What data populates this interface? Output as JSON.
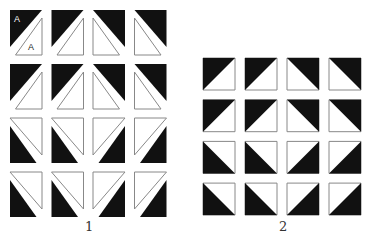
{
  "figure1": {
    "label": "1",
    "tile_letter": "A",
    "origin": {
      "x": 10,
      "y": 10
    },
    "tile_w": 32,
    "tile_h": 45,
    "col_step": 41.5,
    "row_step": 54,
    "rows": [
      [
        "tl",
        "tl",
        "tr",
        "tr"
      ],
      [
        "tl",
        "tl",
        "tr",
        "tr"
      ],
      [
        "bl",
        "bl",
        "br",
        "br"
      ],
      [
        "bl",
        "bl",
        "br",
        "br"
      ]
    ]
  },
  "figure2": {
    "label": "2",
    "origin": {
      "x": 203,
      "y": 58
    },
    "tile_size": 32,
    "col_step": 42,
    "row_step": 41.7,
    "rows": [
      [
        "tl",
        "tl",
        "tr",
        "tr"
      ],
      [
        "tl",
        "tl",
        "tr",
        "tr"
      ],
      [
        "bl",
        "bl",
        "br",
        "br"
      ],
      [
        "bl",
        "bl",
        "br",
        "br"
      ]
    ]
  },
  "colors": {
    "dark": "#111111",
    "stroke": "#888888",
    "background": "#ffffff"
  }
}
